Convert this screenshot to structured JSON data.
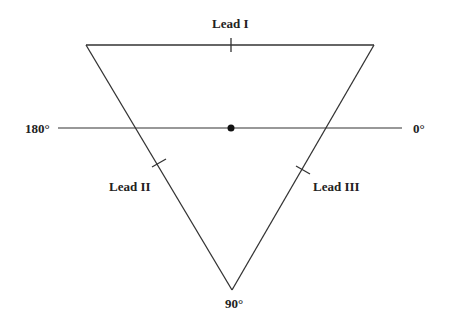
{
  "diagram": {
    "labels": {
      "lead1": "Lead I",
      "lead2": "Lead II",
      "lead3": "Lead III",
      "angle_180": "180°",
      "angle_0": "0°",
      "angle_90": "90°"
    },
    "colors": {
      "line": "#333333",
      "text": "#222222",
      "background": "#ffffff"
    }
  }
}
